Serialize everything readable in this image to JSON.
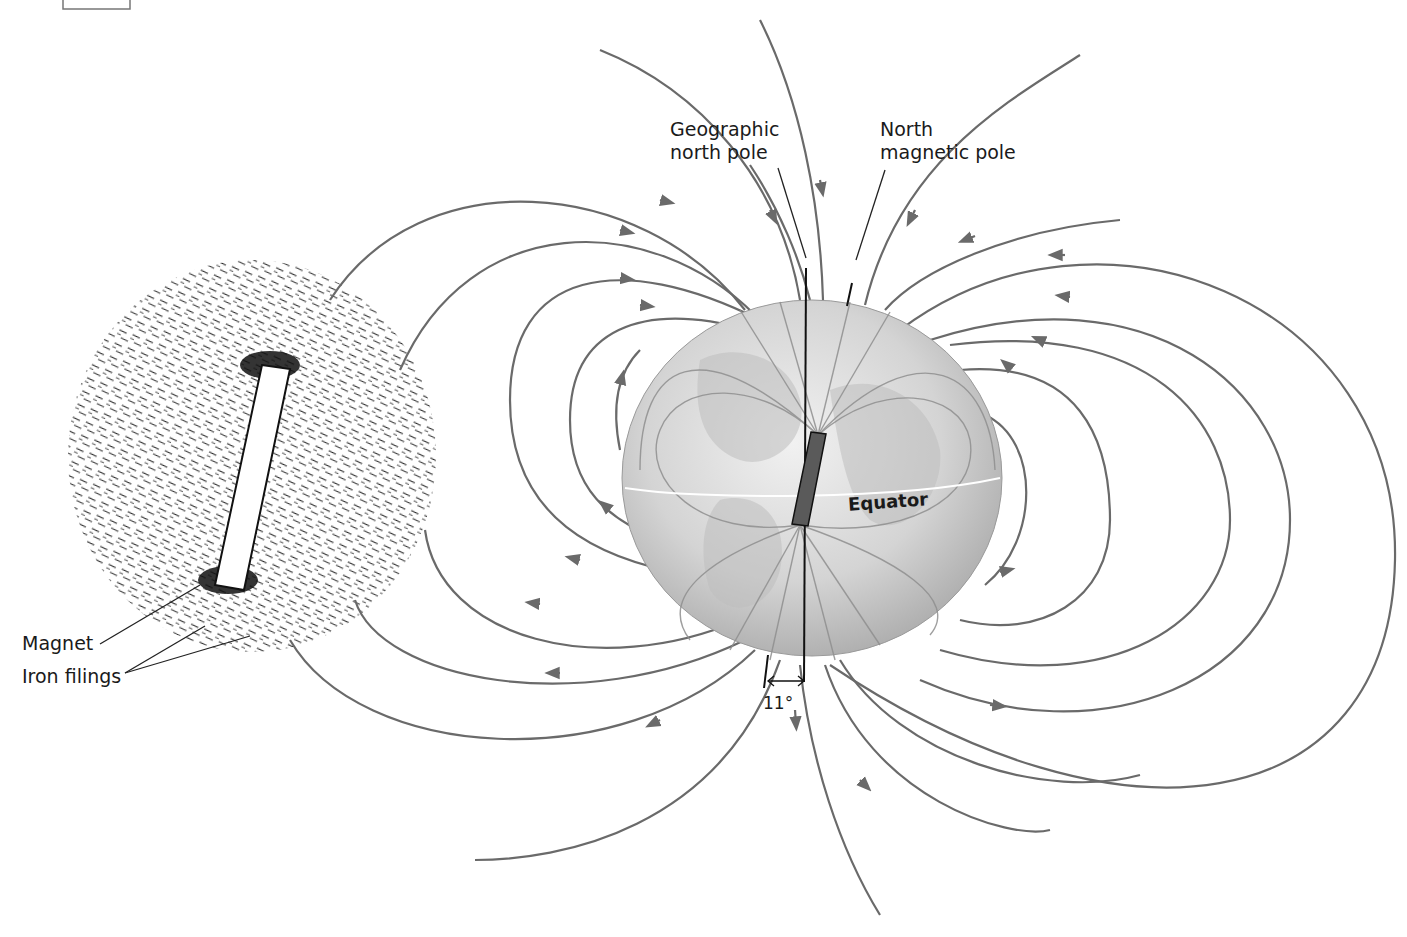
{
  "figure": {
    "labels": {
      "geographic_north_pole": [
        "Geographic",
        "north pole"
      ],
      "north_magnetic_pole": [
        "North",
        "magnetic pole"
      ],
      "equator": "Equator",
      "magnet": "Magnet",
      "iron_filings": "Iron filings",
      "declination_angle": "11°"
    },
    "colors": {
      "field_lines": "#6a6a6a",
      "leader_lines": "#222222",
      "globe_fill": "#cfcfcf",
      "bar_magnet_earth": "#5a5a5a",
      "background": "#ffffff"
    },
    "panels": [
      {
        "name": "iron-filings-panel",
        "description": "Bar magnet with iron filings aligned along field lines"
      },
      {
        "name": "earth-globe-panel",
        "description": "Earth with internal bar magnet tilted 11° from rotation axis; field lines exit south, enter north"
      }
    ]
  }
}
